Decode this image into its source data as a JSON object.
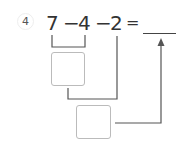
{
  "problem": {
    "number": "4",
    "terms": [
      "7",
      "−",
      "4",
      "−",
      "2",
      "="
    ],
    "answer_blank": "",
    "box1_value": "",
    "box2_value": ""
  }
}
